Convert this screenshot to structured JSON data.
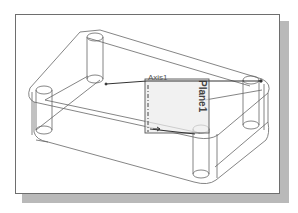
{
  "figure": {
    "type": "cad-wireframe",
    "labels": {
      "axis": "Axis1",
      "plane": "Plane1"
    },
    "colors": {
      "line": "#555555",
      "frame_border": "#6e6e6e",
      "shadow": "#b9b9b9",
      "plane_fill": "#e6e6e6",
      "axis_line": "#333333"
    }
  }
}
